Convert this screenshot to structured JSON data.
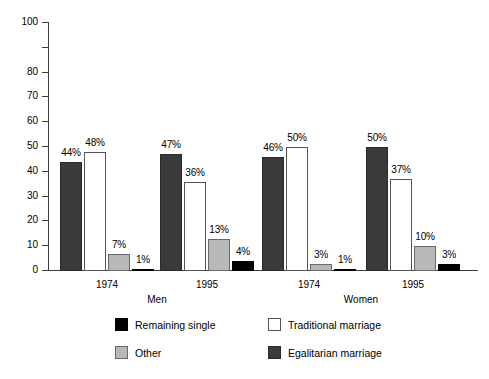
{
  "chart_data": {
    "type": "bar",
    "title": "",
    "subtitle": "",
    "xlabel": "",
    "ylabel": "",
    "ylim": [
      0,
      100
    ],
    "grid": false,
    "legend_position": "bottom",
    "categories": [
      "1974",
      "1995",
      "1974",
      "1995"
    ],
    "group_labels": [
      "Men",
      "Women"
    ],
    "y_ticks": [
      100,
      80,
      70,
      60,
      50,
      40,
      30,
      20,
      10,
      0
    ],
    "y_tick_labels": [
      "100",
      "80",
      "70",
      "60",
      "50",
      "40",
      "30",
      "20",
      "10",
      "0"
    ],
    "series": [
      {
        "name": "Egalitarian marriage",
        "color": "#3a3a3a",
        "values": [
          44,
          47,
          46,
          50
        ],
        "data_labels": [
          "44%",
          "47%",
          "46%",
          "50%"
        ]
      },
      {
        "name": "Traditional marriage",
        "color": "#ffffff",
        "values": [
          48,
          36,
          50,
          37
        ],
        "data_labels": [
          "48%",
          "36%",
          "50%",
          "37%"
        ]
      },
      {
        "name": "Other",
        "color": "#b8b8b8",
        "values": [
          7,
          13,
          3,
          10
        ],
        "data_labels": [
          "7%",
          "13%",
          "3%",
          "10%"
        ]
      },
      {
        "name": "Remaining single",
        "color": "#000000",
        "values": [
          1,
          4,
          1,
          3
        ],
        "data_labels": [
          "1%",
          "4%",
          "1%",
          "3%"
        ]
      }
    ],
    "legend": [
      {
        "label": "Remaining single",
        "color": "#000000",
        "swatch": "sw-single"
      },
      {
        "label": "Traditional marriage",
        "color": "#ffffff",
        "swatch": "sw-traditional"
      },
      {
        "label": "Other",
        "color": "#b8b8b8",
        "swatch": "sw-other"
      },
      {
        "label": "Egalitarian marriage",
        "color": "#3a3a3a",
        "swatch": "sw-egalitarian"
      }
    ]
  },
  "axis": {
    "ticks": [
      {
        "label": "100",
        "value": 100
      },
      {
        "label": "80",
        "value": 80
      },
      {
        "label": "70",
        "value": 70
      },
      {
        "label": "60",
        "value": 60
      },
      {
        "label": "50",
        "value": 50
      },
      {
        "label": "40",
        "value": 40
      },
      {
        "label": "30",
        "value": 30
      },
      {
        "label": "20",
        "value": 20
      },
      {
        "label": "10",
        "value": 10
      },
      {
        "label": "0",
        "value": 0
      }
    ]
  },
  "groups": [
    {
      "year": "1974",
      "section": "Men"
    },
    {
      "year": "1995",
      "section": "Men"
    },
    {
      "year": "1974",
      "section": "Women"
    },
    {
      "year": "1995",
      "section": "Women"
    }
  ],
  "sections": [
    {
      "label": "Men"
    },
    {
      "label": "Women"
    }
  ],
  "legend_items": [
    {
      "label": "Remaining single"
    },
    {
      "label": "Traditional marriage"
    },
    {
      "label": "Other"
    },
    {
      "label": "Egalitarian marriage"
    }
  ]
}
